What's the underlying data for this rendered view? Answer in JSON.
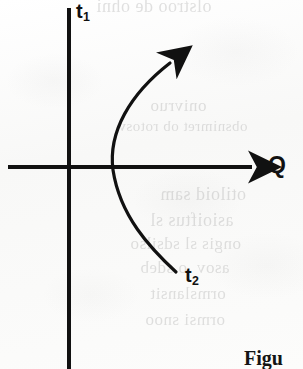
{
  "figure": {
    "kind": "scanned-book-figure",
    "background_color": "#fbfbfa",
    "ink_color": "#111111"
  },
  "axes": {
    "vertical": {
      "label": "t",
      "subscript": "1",
      "name": "t1-axis",
      "x": 69,
      "y_top": 8,
      "y_bottom": 369,
      "stroke_width": 4
    },
    "horizontal": {
      "label": "Q",
      "name": "q-axis",
      "y": 167,
      "x_left": 8,
      "x_right": 258,
      "stroke_width": 4,
      "has_arrowhead": true
    }
  },
  "trajectory": {
    "name": "trajectory-curve",
    "start_label": "t",
    "start_subscript": "2",
    "end_has_arrowhead": true,
    "stroke_width": 3,
    "path": "M 176 272 C 150 248, 120 215, 113 170 C 108 130, 128 92, 176 59",
    "arrow_tip_x": 178,
    "arrow_tip_y": 58,
    "axis_crossing_x": 117
  },
  "labels": {
    "t1": {
      "text": "t",
      "sub": "1",
      "x": 76,
      "y": 2
    },
    "t2": {
      "text": "t",
      "sub": "2",
      "x": 185,
      "y": 266
    },
    "q": {
      "text": "Q",
      "x": 268,
      "y": 153
    }
  },
  "caption": {
    "text": "Figu",
    "note": "cropped caption fragment at bottom-right",
    "x": 244,
    "y": 347
  },
  "bleed_through": [
    {
      "text": "olstroo de ohni",
      "x": 96,
      "y": -4,
      "size": 18
    },
    {
      "text": "onivruo",
      "x": 150,
      "y": 96,
      "size": 17
    },
    {
      "text": "obsnimret ob rotosv",
      "x": 118,
      "y": 118,
      "size": 15
    },
    {
      "text": "otiloid sam",
      "x": 160,
      "y": 184,
      "size": 18
    },
    {
      "text": "asioiftus sl",
      "x": 150,
      "y": 210,
      "size": 18
    },
    {
      "text": "ongis sl sdsilso",
      "x": 130,
      "y": 234,
      "size": 17
    },
    {
      "text": "asov .o sdeb",
      "x": 140,
      "y": 258,
      "size": 17
    },
    {
      "text": "ormslansit",
      "x": 150,
      "y": 284,
      "size": 17
    },
    {
      "text": "ormsi snoo",
      "x": 145,
      "y": 310,
      "size": 17
    }
  ]
}
